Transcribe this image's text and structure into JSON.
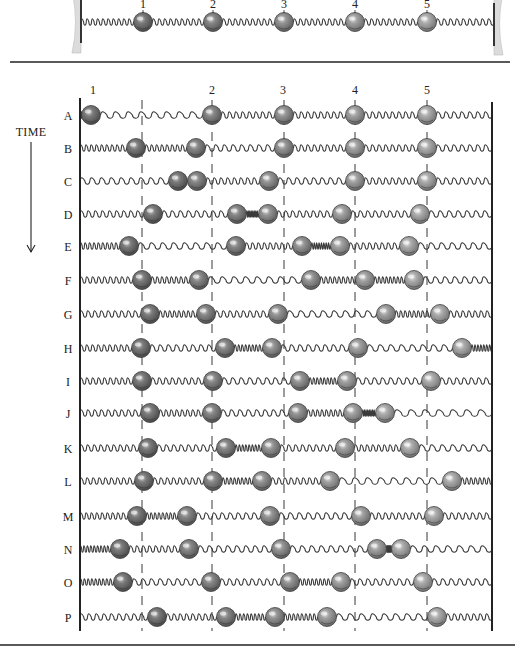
{
  "figure": {
    "title_label": "TIME",
    "colors": {
      "ink": "#222222",
      "spring": "#3a3a3a",
      "wall_support": "#dcdcdc",
      "ball_shades": [
        "#6e6e6e",
        "#7c7c7c",
        "#8a8a8a",
        "#999999",
        "#a8a8a8"
      ]
    },
    "equilibrium_x": [
      142,
      212,
      284,
      355,
      427
    ],
    "ball_labels": [
      "1",
      "2",
      "3",
      "4",
      "5"
    ]
  },
  "reference_chain": {
    "left_wall_x": 81,
    "right_wall_x": 494,
    "y": 22,
    "label_y": 8,
    "ball_x": [
      143,
      213,
      284,
      355,
      427
    ],
    "label_x": [
      143,
      213,
      284,
      355,
      427
    ]
  },
  "time_series": {
    "left_wall_x": 80,
    "right_wall_x": 492,
    "top_y": 98,
    "bottom_y": 631,
    "column_labels": [
      {
        "text": "1",
        "x": 93
      },
      {
        "text": "2",
        "x": 212
      },
      {
        "text": "3",
        "x": 283
      },
      {
        "text": "4",
        "x": 355
      },
      {
        "text": "5",
        "x": 427
      }
    ],
    "column_label_y": 94,
    "rows": [
      {
        "label": "A",
        "y": 115,
        "balls": [
          91,
          212,
          284,
          355,
          427
        ]
      },
      {
        "label": "B",
        "y": 148,
        "balls": [
          136,
          196,
          284,
          355,
          427
        ]
      },
      {
        "label": "C",
        "y": 181,
        "balls": [
          178,
          197,
          269,
          355,
          427
        ]
      },
      {
        "label": "D",
        "y": 214,
        "balls": [
          153,
          237,
          268,
          342,
          420
        ]
      },
      {
        "label": "E",
        "y": 246,
        "balls": [
          129,
          236,
          302,
          340,
          409
        ]
      },
      {
        "label": "F",
        "y": 280,
        "balls": [
          142,
          199,
          311,
          365,
          414
        ]
      },
      {
        "label": "G",
        "y": 314,
        "balls": [
          150,
          206,
          278,
          386,
          440
        ]
      },
      {
        "label": "H",
        "y": 348,
        "balls": [
          141,
          225,
          272,
          358,
          462
        ]
      },
      {
        "label": "I",
        "y": 381,
        "balls": [
          142,
          213,
          300,
          347,
          431
        ]
      },
      {
        "label": "J",
        "y": 413,
        "balls": [
          150,
          212,
          298,
          353,
          385
        ]
      },
      {
        "label": "K",
        "y": 448,
        "balls": [
          148,
          226,
          271,
          345,
          410
        ]
      },
      {
        "label": "L",
        "y": 481,
        "balls": [
          144,
          213,
          262,
          330,
          452
        ]
      },
      {
        "label": "M",
        "y": 516,
        "balls": [
          137,
          187,
          270,
          361,
          434
        ]
      },
      {
        "label": "N",
        "y": 549,
        "balls": [
          120,
          189,
          281,
          377,
          401
        ]
      },
      {
        "label": "O",
        "y": 582,
        "balls": [
          123,
          211,
          290,
          341,
          423
        ]
      },
      {
        "label": "P",
        "y": 617,
        "balls": [
          157,
          226,
          275,
          327,
          437
        ]
      }
    ]
  },
  "time_axis": {
    "label": "TIME",
    "label_x": 31,
    "label_y": 136,
    "arrow_x": 31,
    "arrow_top": 142,
    "arrow_bottom": 252,
    "direction": "down-arrow"
  },
  "separators": [
    {
      "y": 62,
      "x1": 10,
      "x2": 510
    },
    {
      "y": 645,
      "x1": 0,
      "x2": 515
    }
  ]
}
